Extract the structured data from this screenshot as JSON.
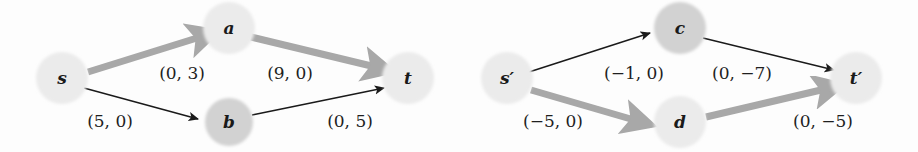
{
  "figure": {
    "kind": "graph-diagram-pair",
    "background_color": "#fdfdfd",
    "thin_edge_color": "#1a1a1a",
    "thick_edge_color": "#a8a8a8",
    "node_light_color": "#ebebeb",
    "node_medium_color": "#d2d2d2"
  },
  "graphs": [
    {
      "id": "left-graph",
      "nodes": [
        {
          "id": "s",
          "label": "s",
          "cx": 62,
          "cy": 78,
          "r": 26,
          "shade": "light"
        },
        {
          "id": "a",
          "label": "a",
          "cx": 229,
          "cy": 28,
          "r": 26,
          "shade": "light"
        },
        {
          "id": "b",
          "label": "b",
          "cx": 229,
          "cy": 122,
          "r": 24,
          "shade": "medium"
        },
        {
          "id": "t",
          "label": "t",
          "cx": 408,
          "cy": 78,
          "r": 26,
          "shade": "light"
        }
      ],
      "edges": [
        {
          "id": "s-a",
          "from": "s",
          "to": "a",
          "style": "thick",
          "label": "(0, 3)",
          "label_x": 182,
          "label_y": 74
        },
        {
          "id": "a-t",
          "from": "a",
          "to": "t",
          "style": "thick",
          "label": "(9, 0)",
          "label_x": 290,
          "label_y": 74
        },
        {
          "id": "s-b",
          "from": "s",
          "to": "b",
          "style": "thin",
          "label": "(5, 0)",
          "label_x": 110,
          "label_y": 122
        },
        {
          "id": "b-t",
          "from": "b",
          "to": "t",
          "style": "thin",
          "label": "(0, 5)",
          "label_x": 350,
          "label_y": 122
        }
      ]
    },
    {
      "id": "right-graph",
      "nodes": [
        {
          "id": "sp",
          "label": "s′",
          "cx": 507,
          "cy": 78,
          "r": 26,
          "shade": "light"
        },
        {
          "id": "c",
          "label": "c",
          "cx": 680,
          "cy": 28,
          "r": 26,
          "shade": "medium"
        },
        {
          "id": "d",
          "label": "d",
          "cx": 680,
          "cy": 122,
          "r": 26,
          "shade": "light"
        },
        {
          "id": "tp",
          "label": "t′",
          "cx": 856,
          "cy": 78,
          "r": 26,
          "shade": "light"
        }
      ],
      "edges": [
        {
          "id": "sp-c",
          "from": "sp",
          "to": "c",
          "style": "thin",
          "label": "(−1, 0)",
          "label_x": 634,
          "label_y": 74
        },
        {
          "id": "c-tp",
          "from": "c",
          "to": "tp",
          "style": "thin",
          "label": "(0, −7)",
          "label_x": 742,
          "label_y": 74
        },
        {
          "id": "sp-d",
          "from": "sp",
          "to": "d",
          "style": "thick",
          "label": "(−5, 0)",
          "label_x": 553,
          "label_y": 122
        },
        {
          "id": "d-tp",
          "from": "d",
          "to": "tp",
          "style": "thick",
          "label": "(0, −5)",
          "label_x": 823,
          "label_y": 122
        }
      ]
    }
  ]
}
